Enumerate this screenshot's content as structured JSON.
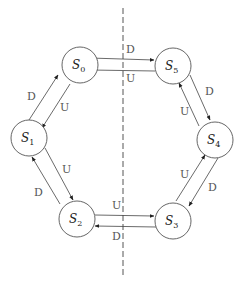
{
  "diagram": {
    "type": "state-transition",
    "states": [
      {
        "id": "S0",
        "label": "S",
        "sub": "0",
        "cx": 71,
        "cy": 65
      },
      {
        "id": "S1",
        "label": "S",
        "sub": "1",
        "cx": 29,
        "cy": 138
      },
      {
        "id": "S2",
        "label": "S",
        "sub": "2",
        "cx": 76,
        "cy": 218
      },
      {
        "id": "S3",
        "label": "S",
        "sub": "3",
        "cx": 173,
        "cy": 219
      },
      {
        "id": "S4",
        "label": "S",
        "sub": "4",
        "cx": 215,
        "cy": 140
      },
      {
        "id": "S5",
        "label": "S",
        "sub": "5",
        "cx": 173,
        "cy": 66
      }
    ],
    "transitions": [
      {
        "from": "S0",
        "to": "S5",
        "label": "D"
      },
      {
        "from": "S5",
        "to": "S0",
        "label": "U"
      },
      {
        "from": "S5",
        "to": "S4",
        "label": "D"
      },
      {
        "from": "S4",
        "to": "S5",
        "label": "U"
      },
      {
        "from": "S4",
        "to": "S3",
        "label": "D"
      },
      {
        "from": "S3",
        "to": "S4",
        "label": "U"
      },
      {
        "from": "S3",
        "to": "S2",
        "label": "D"
      },
      {
        "from": "S2",
        "to": "S3",
        "label": "U"
      },
      {
        "from": "S2",
        "to": "S1",
        "label": "D"
      },
      {
        "from": "S1",
        "to": "S2",
        "label": "U"
      },
      {
        "from": "S1",
        "to": "S0",
        "label": "D"
      },
      {
        "from": "S0",
        "to": "S1",
        "label": "U"
      }
    ],
    "labels": {
      "s0_s5": "D",
      "s5_s0": "U",
      "s5_s4": "D",
      "s4_s5": "U",
      "s4_s3": "D",
      "s3_s4": "U",
      "s3_s2": "D",
      "s2_s3": "U",
      "s2_s1": "D",
      "s1_s2": "U",
      "s1_s0": "D",
      "s0_s1": "U"
    },
    "state_labels": {
      "s0": {
        "main": "S",
        "sub": "0"
      },
      "s1": {
        "main": "S",
        "sub": "1"
      },
      "s2": {
        "main": "S",
        "sub": "2"
      },
      "s3": {
        "main": "S",
        "sub": "3"
      },
      "s4": {
        "main": "S",
        "sub": "4"
      },
      "s5": {
        "main": "S",
        "sub": "5"
      }
    },
    "divider": {
      "style": "dashed",
      "orientation": "vertical"
    }
  }
}
